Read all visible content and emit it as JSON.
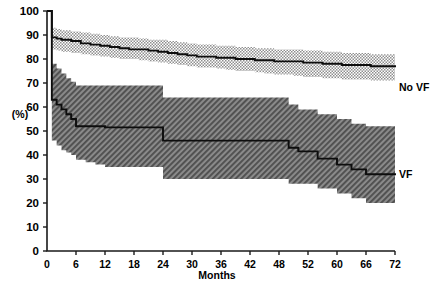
{
  "chart_data": {
    "type": "line",
    "title": "",
    "xlabel": "Months",
    "ylabel": "(%)",
    "xlim": [
      0,
      72
    ],
    "ylim": [
      0,
      100
    ],
    "grid": false,
    "legend_position": "right-inline",
    "xticks": [
      0,
      6,
      12,
      18,
      24,
      30,
      36,
      42,
      48,
      52,
      60,
      66,
      72
    ],
    "xtick_labels": [
      "0",
      "6",
      "12",
      "18",
      "24",
      "30",
      "36",
      "42",
      "48",
      "52",
      "60",
      "66",
      "72"
    ],
    "yticks": [
      0,
      10,
      20,
      30,
      40,
      50,
      60,
      70,
      80,
      90,
      100
    ],
    "ytick_labels": [
      "0",
      "10",
      "20",
      "30",
      "40",
      "50",
      "60",
      "70",
      "80",
      "90",
      "100"
    ],
    "series": [
      {
        "name": "No VF",
        "label": "No VF",
        "band_style": "checkered",
        "band_color": "#9a9a9a",
        "line_color": "#0d0d0d",
        "x": [
          0,
          1,
          2,
          3,
          5,
          7,
          9,
          11,
          13,
          15,
          17,
          19,
          21,
          23,
          25,
          27,
          29,
          31,
          33,
          35,
          37,
          39,
          41,
          43,
          45,
          47,
          49,
          51,
          53,
          55,
          57,
          59,
          61,
          63,
          65,
          67,
          69,
          71,
          72
        ],
        "y": [
          100,
          89,
          88.5,
          88,
          87.5,
          86.5,
          86,
          85.5,
          85,
          84.5,
          84,
          84,
          83.5,
          83,
          82.5,
          82,
          81.5,
          81,
          81,
          80.5,
          80.5,
          80,
          80,
          79.5,
          79.5,
          79,
          79,
          79,
          78.5,
          78.5,
          78,
          78,
          77.5,
          77.5,
          77.5,
          77,
          77,
          77,
          77
        ],
        "band_upper": [
          100,
          93,
          92.5,
          92,
          91.5,
          91,
          90.5,
          90,
          89.5,
          89,
          89,
          88.5,
          88,
          88,
          87.5,
          87,
          86.5,
          86,
          86,
          85.5,
          85.5,
          85,
          85,
          84.5,
          84.5,
          84,
          84,
          84,
          83.5,
          83.5,
          83,
          83,
          82.5,
          82.5,
          82.5,
          82,
          82,
          82,
          82
        ],
        "band_lower": [
          100,
          84,
          83.5,
          83,
          82.5,
          82,
          81.5,
          81,
          80.5,
          80,
          80,
          79.5,
          79,
          78.5,
          78,
          77.5,
          77,
          76.5,
          76.5,
          76,
          75.5,
          75,
          75,
          74.5,
          74,
          73.5,
          73.5,
          73,
          72.5,
          72.5,
          72,
          72,
          71.5,
          71.5,
          71.5,
          71,
          71,
          71,
          71
        ]
      },
      {
        "name": "VF",
        "label": "VF",
        "band_style": "diagonal-hatch",
        "band_color": "#6e6e6e",
        "line_color": "#0d0d0d",
        "x": [
          0,
          1,
          2,
          3,
          4,
          5,
          6,
          8,
          10,
          12,
          22,
          24,
          48,
          50,
          52,
          56,
          60,
          63,
          66,
          72
        ],
        "y": [
          100,
          63,
          61,
          59,
          57,
          55,
          52,
          52,
          52,
          51.5,
          51.5,
          46,
          46,
          43,
          41.5,
          38.5,
          36,
          34,
          32,
          32
        ],
        "band_upper": [
          100,
          78,
          76,
          74,
          72,
          70.5,
          69,
          69,
          69,
          69,
          69,
          64,
          64,
          61,
          59,
          57,
          55,
          53,
          52,
          52
        ],
        "band_lower": [
          100,
          46,
          44,
          42,
          41,
          40,
          38,
          37,
          36,
          35,
          35,
          30,
          30,
          28,
          28,
          26,
          24,
          22,
          20,
          20
        ]
      }
    ],
    "annotations": []
  },
  "legend": {
    "no_vf": "No VF",
    "vf": "VF"
  },
  "axis": {
    "x_title": "Months",
    "y_title": "(%)"
  }
}
